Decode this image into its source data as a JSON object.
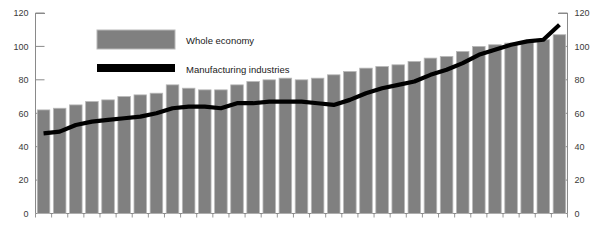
{
  "chart_data": {
    "type": "bar",
    "title": "",
    "subtitle": "",
    "xlabel": "",
    "ylabel": "",
    "ylim": [
      0,
      120
    ],
    "y_ticks": [
      0,
      20,
      40,
      60,
      80,
      100,
      120
    ],
    "grid": false,
    "dual_axis": true,
    "left_axis_ticks": [
      0,
      20,
      40,
      60,
      80,
      100,
      120
    ],
    "right_axis_ticks": [
      0,
      20,
      40,
      60,
      80,
      100,
      120
    ],
    "legend_position": "top-left-inside",
    "categories": [
      "1",
      "2",
      "3",
      "4",
      "5",
      "6",
      "7",
      "8",
      "9",
      "10",
      "11",
      "12",
      "13",
      "14",
      "15",
      "16",
      "17",
      "18",
      "19",
      "20",
      "21",
      "22",
      "23",
      "24",
      "25",
      "26",
      "27",
      "28",
      "29",
      "30",
      "31",
      "32",
      "33"
    ],
    "series": [
      {
        "name": "Whole economy",
        "type": "bar",
        "color": "#808080",
        "values": [
          62,
          63,
          65,
          67,
          68,
          70,
          71,
          72,
          77,
          75,
          74,
          74,
          77,
          79,
          80,
          81,
          80,
          81,
          83,
          85,
          87,
          88,
          89,
          91,
          93,
          94,
          97,
          100,
          101,
          102,
          103,
          104,
          107
        ]
      },
      {
        "name": "Manufacturing industries",
        "type": "line",
        "color": "#000000",
        "values": [
          48,
          49,
          53,
          55,
          56,
          57,
          58,
          60,
          63,
          64,
          64,
          63,
          66,
          66,
          67,
          67,
          67,
          66,
          65,
          68,
          72,
          75,
          77,
          79,
          83,
          86,
          90,
          95,
          98,
          101,
          103,
          104,
          113
        ]
      }
    ]
  },
  "axis": {
    "left_ticks": [
      "120",
      "100",
      "80",
      "60",
      "40",
      "20",
      "0"
    ],
    "right_ticks": [
      "120",
      "100",
      "80",
      "60",
      "40",
      "20",
      "0"
    ]
  },
  "legend": {
    "items": [
      {
        "label": "Whole economy",
        "swatch": "bar-swatch",
        "color": "#808080"
      },
      {
        "label": "Manufacturing industries",
        "swatch": "line-swatch",
        "color": "#000000"
      }
    ]
  },
  "cropped_header": {
    "ghost_text": ""
  },
  "colors": {
    "bar_fill": "#808080",
    "bar_edge": "#b8b8b8",
    "line": "#000000",
    "axis": "#8a8a8a",
    "text": "#3a3a3a",
    "background": "#ffffff"
  }
}
